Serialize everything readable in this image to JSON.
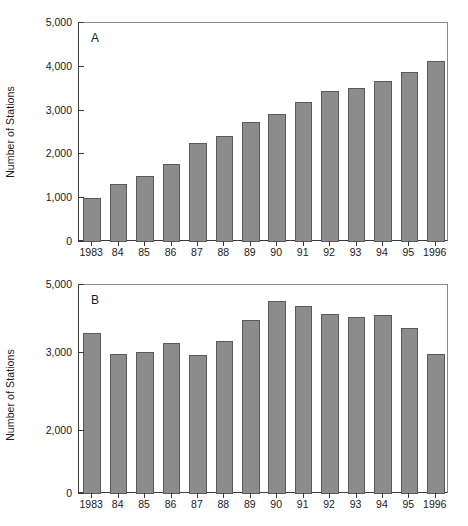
{
  "chart_data": [
    {
      "type": "bar",
      "panel": "A",
      "title": "",
      "xlabel": "",
      "ylabel": "Number of Stations",
      "categories": [
        "1983",
        "84",
        "85",
        "86",
        "87",
        "88",
        "89",
        "90",
        "91",
        "92",
        "93",
        "94",
        "95",
        "1996"
      ],
      "values": [
        1000,
        1320,
        1500,
        1770,
        2250,
        2430,
        2740,
        2930,
        3200,
        3450,
        3520,
        3680,
        3880,
        4140
      ],
      "yticks": [
        0,
        1000,
        2000,
        3000,
        4000,
        5000
      ],
      "ytick_labels": [
        "0",
        "1,000",
        "2,000",
        "3,000",
        "4,000",
        "5,000"
      ],
      "ylim": [
        0,
        5000
      ],
      "axis_scale": "linear",
      "grid": false,
      "legend": "none",
      "bar_color": "#8c8c8c",
      "bar_edge_color": "#5a5a5a"
    },
    {
      "type": "bar",
      "panel": "B",
      "title": "",
      "xlabel": "",
      "ylabel": "Number of Stations",
      "categories": [
        "1983",
        "84",
        "85",
        "86",
        "87",
        "88",
        "89",
        "90",
        "91",
        "92",
        "93",
        "94",
        "95",
        "1996"
      ],
      "values": [
        3600,
        2990,
        3040,
        3280,
        2970,
        3360,
        3980,
        4520,
        4390,
        4160,
        4050,
        4130,
        3750,
        2990
      ],
      "yticks": [
        0,
        2000,
        3000,
        5000
      ],
      "ytick_labels": [
        "0",
        "2,000",
        "3,000",
        "5,000"
      ],
      "ytick_positions": [
        493,
        430,
        352,
        284
      ],
      "ylim": [
        0,
        5000
      ],
      "axis_scale": "broken-nonlinear",
      "grid": false,
      "legend": "none",
      "bar_color": "#8c8c8c",
      "bar_edge_color": "#5a5a5a"
    }
  ]
}
